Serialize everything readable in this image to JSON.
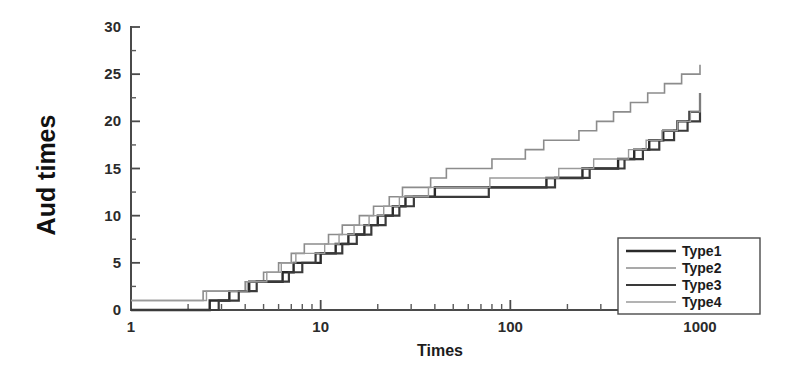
{
  "chart_data": {
    "type": "line",
    "title": "",
    "subtitle": "",
    "xlabel": "Times",
    "ylabel": "Aud times",
    "xscale": "log",
    "yscale": "linear",
    "xlim": [
      1,
      1000
    ],
    "ylim": [
      0,
      30
    ],
    "grid": false,
    "legend_position": "bottom-right",
    "xticks": [
      1,
      10,
      100,
      1000
    ],
    "xtick_labels": [
      "1",
      "10",
      "100",
      "1000"
    ],
    "yticks": [
      0,
      5,
      10,
      15,
      20,
      25,
      30
    ],
    "ytick_labels": [
      "0",
      "5",
      "10",
      "15",
      "20",
      "25",
      "30"
    ],
    "yticks_minor": [
      2.5,
      7.5,
      12.5,
      17.5,
      22.5,
      27.5
    ],
    "step_style": "post",
    "series": [
      {
        "name": "Type1",
        "color": "#2a2a2a",
        "width": 2.4,
        "x": [
          1,
          2,
          2.6,
          3.3,
          4.2,
          5.4,
          6.3,
          7.2,
          8.5,
          10,
          12,
          14,
          17,
          20,
          24,
          28,
          33,
          40,
          48,
          57,
          68,
          82,
          100,
          125,
          155,
          190,
          240,
          300,
          370,
          450,
          540,
          640,
          760,
          880,
          1000
        ],
        "values": [
          0,
          0,
          1,
          2,
          3,
          3,
          4,
          5,
          5,
          6,
          7,
          8,
          9,
          10,
          11,
          12,
          12,
          13,
          13,
          13,
          13,
          13,
          13,
          13,
          14,
          14,
          15,
          15,
          16,
          17,
          18,
          19,
          20,
          21,
          21
        ]
      },
      {
        "name": "Type2",
        "color": "#8c8c8c",
        "width": 1.6,
        "x": [
          1,
          1.8,
          2.4,
          3.1,
          4,
          5,
          6,
          7,
          8.2,
          9.5,
          11,
          13,
          16,
          19,
          23,
          27,
          32,
          38,
          46,
          55,
          66,
          80,
          96,
          120,
          150,
          185,
          230,
          285,
          350,
          430,
          530,
          650,
          800,
          1000
        ],
        "values": [
          1,
          1,
          2,
          2,
          3,
          4,
          5,
          6,
          7,
          7,
          8,
          9,
          10,
          11,
          12,
          13,
          13,
          14,
          15,
          15,
          15,
          16,
          16,
          17,
          18,
          18,
          19,
          20,
          21,
          22,
          23,
          24,
          25,
          26
        ]
      },
      {
        "name": "Type3",
        "color": "#3a3a3a",
        "width": 2.2,
        "x": [
          1,
          2.2,
          2.9,
          3.7,
          4.6,
          5.8,
          6.8,
          8,
          9.4,
          11,
          13,
          15.5,
          18.5,
          22,
          26,
          31,
          37,
          44,
          53,
          64,
          77,
          93,
          113,
          140,
          172,
          212,
          262,
          325,
          400,
          500,
          610,
          730,
          860,
          1000
        ],
        "values": [
          0,
          0,
          1,
          2,
          3,
          3,
          4,
          5,
          6,
          6,
          7,
          8,
          9,
          10,
          11,
          12,
          12,
          12,
          12,
          12,
          13,
          13,
          13,
          13,
          14,
          14,
          15,
          15,
          16,
          17,
          18,
          19,
          20,
          23
        ]
      },
      {
        "name": "Type4",
        "color": "#9a9a9a",
        "width": 1.4,
        "x": [
          1,
          1.9,
          2.5,
          3.2,
          4.1,
          5.2,
          6.2,
          7.4,
          8.8,
          10.5,
          12.5,
          15,
          18,
          21.5,
          26,
          31,
          37,
          45,
          54,
          65,
          78,
          95,
          116,
          145,
          180,
          222,
          275,
          340,
          420,
          520,
          630,
          760,
          890,
          1000
        ],
        "values": [
          1,
          1,
          2,
          2,
          3,
          4,
          5,
          6,
          6,
          7,
          8,
          9,
          10,
          11,
          12,
          12,
          13,
          13,
          13,
          13,
          14,
          14,
          14,
          14,
          15,
          15,
          16,
          16,
          17,
          18,
          19,
          20,
          21,
          23
        ]
      }
    ],
    "legend_entries": [
      {
        "label": "Type1",
        "color": "#2a2a2a",
        "width": 2.4
      },
      {
        "label": "Type2",
        "color": "#8c8c8c",
        "width": 1.6
      },
      {
        "label": "Type3",
        "color": "#3a3a3a",
        "width": 2.2
      },
      {
        "label": "Type4",
        "color": "#9a9a9a",
        "width": 1.4
      }
    ]
  },
  "axes": {
    "x_title": "Times",
    "y_title": "Aud times"
  }
}
